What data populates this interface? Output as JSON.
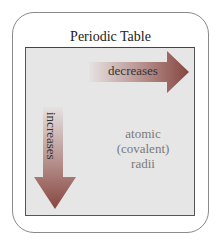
{
  "title": "Periodic Table",
  "horizontal_arrow": {
    "label": "decreases",
    "direction": "right"
  },
  "vertical_arrow": {
    "label": "increases",
    "direction": "down"
  },
  "property": {
    "line1": "atomic",
    "line2": "(covalent)",
    "line3": "radii"
  },
  "colors": {
    "arrow_start": "#e4dede",
    "arrow_end": "#8c4a44",
    "panel": "#e6e6e6",
    "property_text": "#7a7a7a"
  }
}
